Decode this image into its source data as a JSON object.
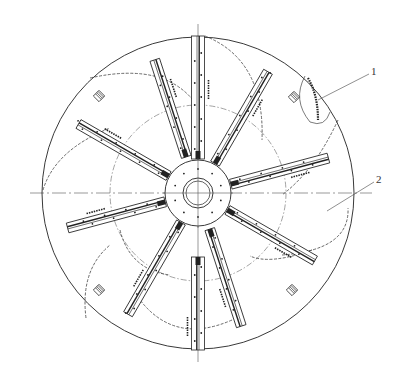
{
  "figure": {
    "type": "engineering-drawing",
    "stroke_color": "#222222",
    "center": [
      198,
      193
    ],
    "outer_circle_radius": 156,
    "inner_dashdot_circle_radius": 88,
    "hub": {
      "outer_radius": 33,
      "ring_radius": 15,
      "bore_radius": 12,
      "bolt_circle_radius": 24
    },
    "centerlines": {
      "horizontal": {
        "x1": 30,
        "x2": 372,
        "y": 193
      },
      "vertical": {
        "x": 198,
        "y1": 24,
        "y2": 362
      }
    },
    "blades": [
      {
        "id": "blade-top",
        "angle": -90,
        "r_start": 34,
        "r_end": 157,
        "width": 13,
        "wide_rect": true
      },
      {
        "id": "blade-upper-left-steep",
        "angle": -108,
        "r_start": 38,
        "r_end": 140,
        "width": 10
      },
      {
        "id": "blade-upper-right",
        "angle": -60,
        "r_start": 34,
        "r_end": 140,
        "width": 10
      },
      {
        "id": "blade-upper-left",
        "angle": -150,
        "r_start": 34,
        "r_end": 138,
        "width": 10
      },
      {
        "id": "blade-right",
        "angle": -15,
        "r_start": 34,
        "r_end": 135,
        "width": 10
      },
      {
        "id": "blade-left",
        "angle": 165,
        "r_start": 34,
        "r_end": 135,
        "width": 10
      },
      {
        "id": "blade-lower-right",
        "angle": 30,
        "r_start": 34,
        "r_end": 135,
        "width": 10
      },
      {
        "id": "blade-lower-left",
        "angle": 120,
        "r_start": 34,
        "r_end": 140,
        "width": 10
      },
      {
        "id": "blade-lower-right-steep",
        "angle": 72,
        "r_start": 38,
        "r_end": 140,
        "width": 10
      },
      {
        "id": "blade-bottom",
        "angle": 90,
        "r_start": 64,
        "r_end": 157,
        "width": 13,
        "wide_rect": true
      }
    ],
    "vent_squares": [
      {
        "x": 99,
        "y": 96
      },
      {
        "x": 294,
        "y": 97
      },
      {
        "x": 99,
        "y": 290
      },
      {
        "x": 292,
        "y": 290
      }
    ],
    "dashed_arcs": [
      "M 90 78 Q 170 60 200 110",
      "M 205 36 Q 265 60 262 140",
      "M 338 120 Q 315 170 282 195",
      "M 312 250 Q 270 265 250 256",
      "M 232 320 Q 175 345 140 300",
      "M 86 318 Q 80 270 110 245",
      "M 43 190 Q 55 150 110 128",
      "M 120 230 Q 130 270 170 275",
      "M 282 255 Q 350 250 348 208"
    ],
    "callouts": [
      {
        "label": "1",
        "x": 372,
        "y": 67,
        "line": [
          318,
          100,
          369,
          74
        ]
      },
      {
        "label": "2",
        "x": 377,
        "y": 175,
        "line": [
          327,
          211,
          374,
          182
        ]
      }
    ]
  },
  "labels": {
    "callout_1": "1",
    "callout_2": "2"
  }
}
